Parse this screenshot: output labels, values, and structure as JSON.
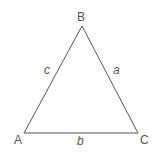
{
  "diagram": {
    "type": "triangle",
    "vertices": [
      {
        "name": "A",
        "label": "A",
        "x": 24,
        "y": 133,
        "lx": 14,
        "ly": 144
      },
      {
        "name": "B",
        "label": "B",
        "x": 82,
        "y": 26,
        "lx": 77,
        "ly": 21
      },
      {
        "name": "C",
        "label": "C",
        "x": 138,
        "y": 133,
        "lx": 140,
        "ly": 144
      }
    ],
    "sides": [
      {
        "name": "a",
        "label": "a",
        "lx": 113,
        "ly": 74
      },
      {
        "name": "b",
        "label": "b",
        "lx": 77,
        "ly": 145
      },
      {
        "name": "c",
        "label": "c",
        "lx": 44,
        "ly": 74
      }
    ],
    "stroke_color": "#555555"
  }
}
